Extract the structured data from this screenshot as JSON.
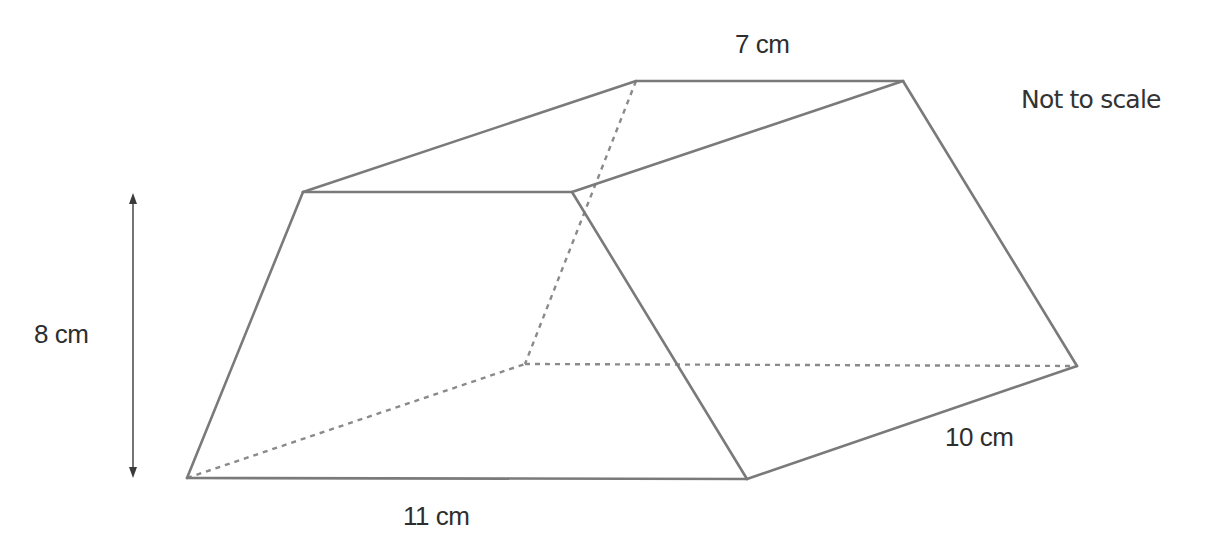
{
  "diagram": {
    "type": "3D prism (trapezoidal prism)",
    "note": "Not to scale",
    "labels": {
      "top_edge": "7 cm",
      "height": "8 cm",
      "bottom_edge": "11 cm",
      "depth": "10 cm"
    },
    "colors": {
      "edge": "#7a7a7a",
      "hidden_edge": "#8a8a8a",
      "text": "#2e2e2e",
      "arrow": "#3a3a3a",
      "background": "#ffffff"
    },
    "vertices": {
      "front_top_left": [
        303,
        192
      ],
      "front_top_right": [
        572,
        192
      ],
      "front_bottom_left": [
        187,
        478
      ],
      "front_bottom_right": [
        747,
        479
      ],
      "back_top_left": [
        636,
        81
      ],
      "back_top_right": [
        903,
        81
      ],
      "back_bottom_left": [
        525,
        364
      ],
      "back_bottom_right": [
        1077,
        366
      ]
    },
    "solid_edges": [
      [
        "front_top_left",
        "front_top_right"
      ],
      [
        "front_top_left",
        "front_bottom_left"
      ],
      [
        "front_bottom_left",
        "front_bottom_right"
      ],
      [
        "front_top_right",
        "front_bottom_right"
      ],
      [
        "front_top_left",
        "back_top_left"
      ],
      [
        "back_top_left",
        "back_top_right"
      ],
      [
        "front_top_right",
        "back_top_right"
      ],
      [
        "back_top_right",
        "back_bottom_right"
      ],
      [
        "front_bottom_right",
        "back_bottom_right"
      ]
    ],
    "hidden_edges": [
      [
        "back_top_left",
        "back_bottom_left"
      ],
      [
        "front_bottom_left",
        "back_bottom_left"
      ],
      [
        "back_bottom_left",
        "back_bottom_right"
      ]
    ],
    "height_arrow": {
      "x": 133,
      "y_top": 193,
      "y_bottom": 478
    }
  }
}
